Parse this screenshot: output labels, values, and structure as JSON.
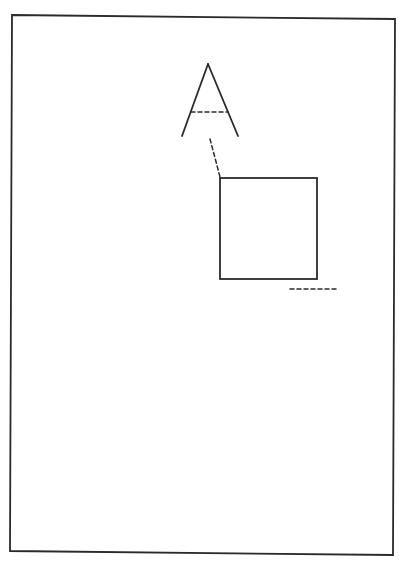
{
  "diagram": {
    "colors": {
      "line": "#2a2a2a",
      "background": "#ffffff"
    },
    "elements": [
      {
        "id": "page-frame",
        "style": "solid"
      },
      {
        "id": "letter-a",
        "style": "solid",
        "crossbar_style": "dashed"
      },
      {
        "id": "connector-line",
        "style": "dashed"
      },
      {
        "id": "square",
        "style": "solid"
      },
      {
        "id": "baseline-mark",
        "style": "dashed"
      }
    ]
  }
}
